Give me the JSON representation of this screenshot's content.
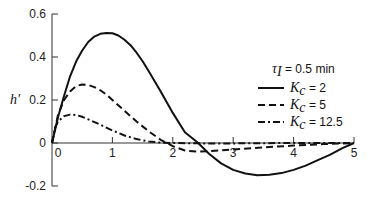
{
  "chart_data": {
    "type": "line",
    "title": "",
    "xlabel": "",
    "ylabel": "h'",
    "xlim": [
      0,
      5
    ],
    "ylim": [
      -0.2,
      0.6
    ],
    "xticks": [
      0,
      1,
      2,
      3,
      4,
      5
    ],
    "yticks": [
      -0.2,
      0,
      0.2,
      0.4,
      0.6
    ],
    "xtick_labels": [
      "0",
      "1",
      "2",
      "3",
      "4",
      "5"
    ],
    "ytick_labels": [
      "-0.2",
      "0",
      "0.2",
      "0.4",
      "0.6"
    ],
    "grid": false,
    "legend_position": "upper right",
    "annotation": {
      "symbol": "τ",
      "subscript": "I",
      "text": " = 0.5 min"
    },
    "series": [
      {
        "name": "Kc = 2",
        "label_symbol": "K",
        "label_sub": "c",
        "label_value": " = 2",
        "style": "solid",
        "x": [
          0,
          0.1,
          0.2,
          0.3,
          0.4,
          0.5,
          0.6,
          0.7,
          0.8,
          0.9,
          1.0,
          1.1,
          1.2,
          1.3,
          1.4,
          1.5,
          1.6,
          1.8,
          2.0,
          2.2,
          2.42,
          2.6,
          2.8,
          3.0,
          3.2,
          3.4,
          3.6,
          3.8,
          4.0,
          4.2,
          4.4,
          4.6,
          4.8,
          5.0
        ],
        "values": [
          0,
          0.12,
          0.22,
          0.31,
          0.38,
          0.43,
          0.47,
          0.495,
          0.508,
          0.512,
          0.51,
          0.5,
          0.48,
          0.455,
          0.42,
          0.38,
          0.335,
          0.24,
          0.14,
          0.05,
          0,
          -0.05,
          -0.095,
          -0.125,
          -0.142,
          -0.15,
          -0.148,
          -0.14,
          -0.125,
          -0.105,
          -0.08,
          -0.055,
          -0.025,
          0
        ]
      },
      {
        "name": "Kc = 5",
        "label_symbol": "K",
        "label_sub": "c",
        "label_value": " = 5",
        "style": "dashed",
        "x": [
          0,
          0.1,
          0.2,
          0.3,
          0.4,
          0.5,
          0.6,
          0.7,
          0.8,
          0.9,
          1.0,
          1.2,
          1.4,
          1.6,
          1.8,
          1.9,
          2.0,
          2.2,
          2.4,
          2.6,
          3.0,
          3.5,
          4.0,
          4.5,
          5.0
        ],
        "values": [
          0,
          0.13,
          0.2,
          0.24,
          0.265,
          0.272,
          0.27,
          0.26,
          0.245,
          0.225,
          0.2,
          0.15,
          0.1,
          0.055,
          0.015,
          0,
          -0.015,
          -0.035,
          -0.04,
          -0.038,
          -0.03,
          -0.02,
          -0.012,
          -0.005,
          0
        ]
      },
      {
        "name": "Kc = 12.5",
        "label_symbol": "K",
        "label_sub": "c",
        "label_value": " = 12.5",
        "style": "dash-dot",
        "x": [
          0,
          0.05,
          0.1,
          0.2,
          0.3,
          0.4,
          0.5,
          0.6,
          0.8,
          1.0,
          1.2,
          1.4,
          1.6,
          1.8,
          2.0,
          2.5,
          3.0,
          3.5,
          4.0,
          5.0
        ],
        "values": [
          0,
          0.07,
          0.1,
          0.125,
          0.132,
          0.13,
          0.122,
          0.11,
          0.085,
          0.058,
          0.035,
          0.018,
          0.007,
          0.002,
          0,
          -0.002,
          -0.002,
          -0.001,
          0,
          0
        ]
      }
    ]
  },
  "plot": {
    "x0": 52,
    "x1": 354,
    "y_zero": 143,
    "y_per_unit": 215,
    "axis_left": 52,
    "axis_top": 15,
    "axis_bottom": 186
  }
}
